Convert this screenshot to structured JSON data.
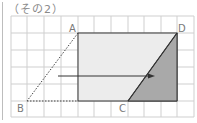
{
  "title": "（その2）",
  "labels": {
    "A": "A",
    "B": "B",
    "C": "C",
    "D": "D"
  },
  "grid": {
    "x_lines": [
      11,
      27,
      44,
      61,
      78,
      94,
      111,
      128,
      144,
      161,
      177,
      194
    ],
    "y_lines": [
      16,
      33,
      50,
      67,
      84,
      101,
      117
    ],
    "color": "#cfcfcf"
  },
  "points": {
    "A": [
      78,
      33
    ],
    "B": [
      27,
      101
    ],
    "C": [
      128,
      101
    ],
    "D": [
      177,
      33
    ]
  },
  "colors": {
    "rect_fill": "#ececec",
    "triangle_fill": "#a9a9a9",
    "stroke": "#333333",
    "dotted": "#444444"
  },
  "arrow": {
    "from": [
      58,
      76
    ],
    "to": [
      153,
      76
    ]
  }
}
